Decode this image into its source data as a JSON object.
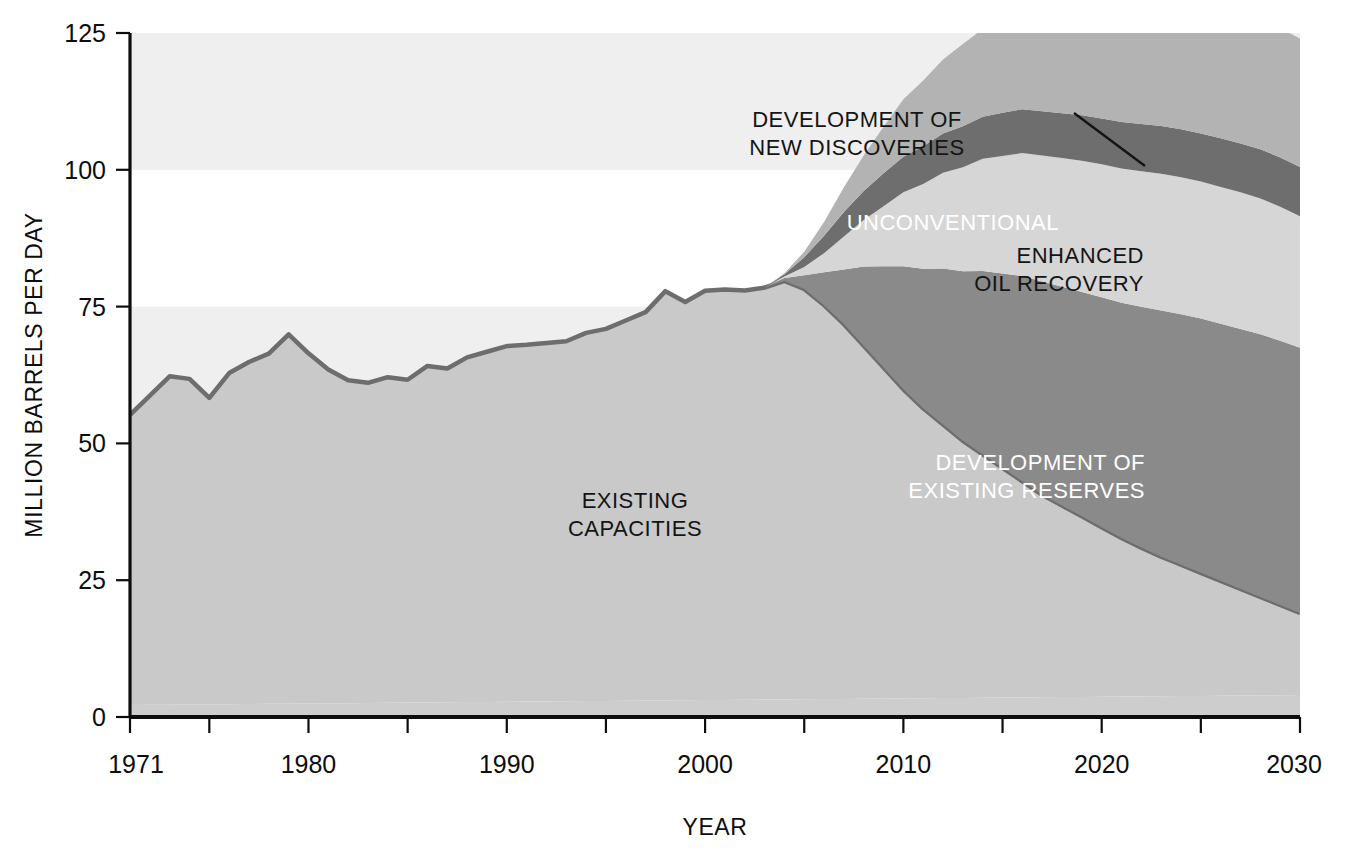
{
  "chart_data": {
    "type": "area",
    "title": "",
    "subtitle": "",
    "xlabel": "YEAR",
    "ylabel": "MILLION BARRELS PER DAY",
    "xlim": [
      1971,
      2030
    ],
    "ylim": [
      0,
      125
    ],
    "grid": false,
    "legend_position": "inline-annotations",
    "stacked": true,
    "y_ticks": [
      0,
      25,
      50,
      75,
      100,
      125
    ],
    "y_tick_labels": [
      "0",
      "25",
      "50",
      "75",
      "100",
      "125"
    ],
    "x_ticks": [
      1971,
      1975,
      1980,
      1985,
      1990,
      1995,
      2000,
      2005,
      2010,
      2015,
      2020,
      2025,
      2030
    ],
    "x_tick_labels": [
      "1971",
      "",
      "1980",
      "",
      "1990",
      "",
      "2000",
      "",
      "2010",
      "",
      "2020",
      "",
      "2030"
    ],
    "x_labeled_ticks": [
      1971,
      1980,
      1990,
      2000,
      2010,
      2020,
      2030
    ],
    "background_bands": [
      {
        "from": 100,
        "to": 125,
        "color": "#efefef"
      },
      {
        "from": 50,
        "to": 75,
        "color": "#efefef"
      }
    ],
    "colors": {
      "base_layer": "#cdcdcd",
      "existing_capacities": "#c9c9c9",
      "development_of_existing_reserves": "#8a8a8a",
      "enhanced_oil_recovery": "#d6d6d6",
      "unconventional": "#6e6e6e",
      "development_of_new_discoveries": "#b3b3b3",
      "outline": "#6d6d6d",
      "axis": "#0d0d0d",
      "background": "#ffffff",
      "band_shade": "#efefef"
    },
    "x": [
      1971,
      1972,
      1973,
      1974,
      1975,
      1976,
      1977,
      1978,
      1979,
      1980,
      1981,
      1982,
      1983,
      1984,
      1985,
      1986,
      1987,
      1988,
      1989,
      1990,
      1991,
      1992,
      1993,
      1994,
      1995,
      1996,
      1997,
      1998,
      1999,
      2000,
      2001,
      2002,
      2003,
      2004,
      2005,
      2006,
      2007,
      2008,
      2009,
      2010,
      2011,
      2012,
      2013,
      2014,
      2015,
      2016,
      2017,
      2018,
      2019,
      2020,
      2021,
      2022,
      2023,
      2024,
      2025,
      2026,
      2027,
      2028,
      2029,
      2030
    ],
    "series": [
      {
        "name": "EXISTING CAPACITIES",
        "label": "EXISTING\nCAPACITIES",
        "color": "#c9c9c9",
        "label_color": "dark",
        "values": [
          53.0,
          56.5,
          60.0,
          59.5,
          56.0,
          60.5,
          62.5,
          64.0,
          67.5,
          64.0,
          61.0,
          59.0,
          58.5,
          59.5,
          59.0,
          61.5,
          61.0,
          63.0,
          64.0,
          65.0,
          65.2,
          65.5,
          65.8,
          67.3,
          68.0,
          69.5,
          71.0,
          74.8,
          72.8,
          74.8,
          75.0,
          74.8,
          75.3,
          76.5,
          75.0,
          72.0,
          68.5,
          64.5,
          60.5,
          56.5,
          53.0,
          50.0,
          47.0,
          44.5,
          42.0,
          39.5,
          37.0,
          35.0,
          33.0,
          31.0,
          29.0,
          27.2,
          25.5,
          24.0,
          22.5,
          21.0,
          19.5,
          18.0,
          16.5,
          15.0
        ]
      },
      {
        "name": "DEVELOPMENT OF EXISTING RESERVES",
        "label": "DEVELOPMENT OF\nEXISTING RESERVES",
        "color": "#8a8a8a",
        "label_color": "light",
        "values": [
          0,
          0,
          0,
          0,
          0,
          0,
          0,
          0,
          0,
          0,
          0,
          0,
          0,
          0,
          0,
          0,
          0,
          0,
          0,
          0,
          0,
          0,
          0,
          0,
          0,
          0,
          0,
          0,
          0,
          0,
          0,
          0,
          0,
          0.5,
          2.5,
          6.0,
          10.0,
          14.5,
          18.5,
          22.5,
          25.5,
          28.5,
          31.0,
          33.5,
          35.5,
          37.5,
          39.0,
          40.0,
          41.0,
          42.0,
          43.0,
          44.0,
          45.0,
          45.8,
          46.5,
          47.0,
          47.5,
          48.0,
          48.3,
          48.5
        ]
      },
      {
        "name": "ENHANCED OIL RECOVERY",
        "label": "ENHANCED\nOIL RECOVERY",
        "color": "#d6d6d6",
        "label_color": "dark",
        "values": [
          0,
          0,
          0,
          0,
          0,
          0,
          0,
          0,
          0,
          0,
          0,
          0,
          0,
          0,
          0,
          0,
          0,
          0,
          0,
          0,
          0,
          0,
          0,
          0,
          0,
          0,
          0,
          0,
          0,
          0,
          0,
          0,
          0,
          0.3,
          1.5,
          3.5,
          6.0,
          8.5,
          11.0,
          13.5,
          15.5,
          17.5,
          19.0,
          20.5,
          21.5,
          22.5,
          23.0,
          23.5,
          24.0,
          24.3,
          24.5,
          24.8,
          25.0,
          25.0,
          25.0,
          25.0,
          25.0,
          24.8,
          24.5,
          24.0
        ]
      },
      {
        "name": "UNCONVENTIONAL",
        "label": "UNCONVENTIONAL",
        "color": "#6e6e6e",
        "label_color": "light",
        "values": [
          0,
          0,
          0,
          0,
          0,
          0,
          0,
          0,
          0,
          0,
          0,
          0,
          0,
          0,
          0,
          0,
          0,
          0,
          0,
          0,
          0,
          0,
          0,
          0,
          0,
          0,
          0,
          0,
          0,
          0,
          0,
          0,
          0,
          0.4,
          1.8,
          3.2,
          4.5,
          5.3,
          6.0,
          6.5,
          6.9,
          7.2,
          7.5,
          7.7,
          7.9,
          8.0,
          8.1,
          8.2,
          8.3,
          8.4,
          8.5,
          8.6,
          8.7,
          8.8,
          8.8,
          8.9,
          8.9,
          9.0,
          9.0,
          9.0
        ]
      },
      {
        "name": "DEVELOPMENT OF NEW DISCOVERIES",
        "label": "DEVELOPMENT OF\nNEW DISCOVERIES",
        "color": "#b3b3b3",
        "label_color": "dark",
        "values": [
          0,
          0,
          0,
          0,
          0,
          0,
          0,
          0,
          0,
          0,
          0,
          0,
          0,
          0,
          0,
          0,
          0,
          0,
          0,
          0,
          0,
          0,
          0,
          0,
          0,
          0,
          0,
          0,
          0,
          0,
          0,
          0,
          0,
          0.2,
          1.0,
          2.5,
          4.5,
          6.5,
          8.5,
          10.5,
          12.0,
          13.5,
          15.0,
          16.0,
          17.0,
          18.0,
          18.8,
          19.5,
          20.2,
          21.0,
          21.5,
          22.0,
          22.4,
          22.8,
          23.0,
          23.2,
          23.4,
          23.5,
          23.6,
          23.5
        ]
      }
    ],
    "base_layer": {
      "name": "base-layer",
      "color": "#cdcdcd",
      "start_value": 2.2,
      "end_value": 4.0
    },
    "totals_note": {
      "2004_total": 77.0,
      "2030_total": 120.0
    },
    "annotations": [
      {
        "name": "development-of-new-discoveries",
        "lines": [
          "DEVELOPMENT OF",
          "NEW DISCOVERIES"
        ],
        "color": "dark",
        "x": 857,
        "y": 127,
        "leader": {
          "x1": 1074,
          "y1": 113,
          "x2": 1145,
          "y2": 166
        }
      },
      {
        "name": "unconventional",
        "lines": [
          "UNCONVENTIONAL"
        ],
        "color": "light",
        "x": 1059,
        "y": 230
      },
      {
        "name": "enhanced-oil-recovery",
        "lines": [
          "ENHANCED",
          "OIL RECOVERY"
        ],
        "color": "dark",
        "x": 1144,
        "y": 263
      },
      {
        "name": "existing-capacities",
        "lines": [
          "EXISTING",
          "CAPACITIES"
        ],
        "color": "dark",
        "x": 635,
        "y": 508
      },
      {
        "name": "development-of-existing-reserves",
        "lines": [
          "DEVELOPMENT OF",
          "EXISTING RESERVES"
        ],
        "color": "light",
        "x": 1145,
        "y": 470
      }
    ]
  },
  "axes": {
    "y_axis_title": "MILLION BARRELS PER DAY",
    "x_axis_title": "YEAR",
    "y_tick_labels": [
      "125",
      "100",
      "75",
      "50",
      "25",
      "0"
    ],
    "x_tick_labels": [
      "1971",
      "1980",
      "1990",
      "2000",
      "2010",
      "2020",
      "2030"
    ]
  }
}
